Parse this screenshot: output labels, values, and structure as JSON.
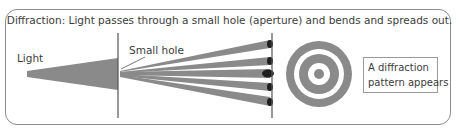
{
  "title": "Diffraction: Light passes through a small hole (aperture) and bends and spreads out.",
  "labels": {
    "light": "Light",
    "small_hole": "Small hole",
    "result_line1": "A diffraction",
    "result_line2": "pattern appears"
  },
  "colors": {
    "beam": "#8a8a8a",
    "ring": "#8a8a8a",
    "spot": "#1e1e1e",
    "line": "#555555",
    "frame": "#8c8c8c"
  },
  "diagram": {
    "beams_count": 5,
    "rings": [
      "outer-ring",
      "middle-ring",
      "center-dot"
    ]
  }
}
